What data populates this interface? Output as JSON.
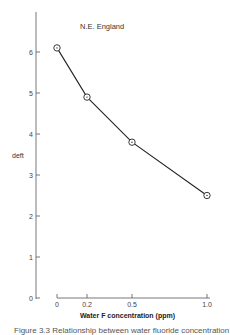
{
  "chart_data": {
    "type": "line",
    "title": "N.E. England",
    "xlabel": "Water F concentration (ppm)",
    "ylabel": "deft",
    "x": [
      0,
      0.2,
      0.5,
      1.0
    ],
    "series": [
      {
        "name": "N.E. England",
        "values": [
          6.1,
          4.9,
          3.8,
          2.5
        ]
      }
    ],
    "xticks": [
      "0",
      "0.2",
      "0.5",
      "1.0"
    ],
    "yticks": [
      "0",
      "1",
      "2",
      "3",
      "4",
      "5",
      "6"
    ],
    "xlim": [
      0,
      1.0
    ],
    "ylim": [
      0,
      7
    ],
    "grid": false,
    "marker": "circle-dot"
  },
  "caption": "Figure 3.3 Relationship between water fluoride concentration"
}
